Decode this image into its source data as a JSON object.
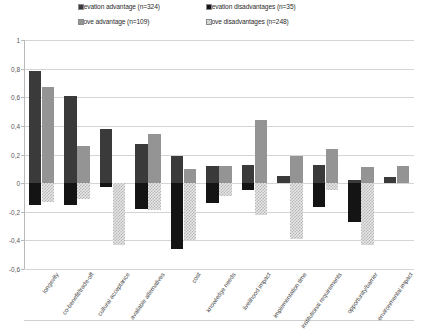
{
  "chart_data": {
    "type": "bar",
    "title": "",
    "subtitle": "",
    "xlabel": "",
    "ylabel": "",
    "ylim": [
      -0.6,
      1.0
    ],
    "ytick_labels": [
      "1",
      "0,8",
      "0,6",
      "0,4",
      "0,2",
      "0",
      "-0,2",
      "-0,4",
      "-0,6"
    ],
    "ytick_values": [
      1,
      0.8,
      0.6,
      0.4,
      0.2,
      0,
      -0.2,
      -0.4,
      -0.6
    ],
    "grid": true,
    "legend_position": "top",
    "orientation": "vertical",
    "bar_mode": "floating-stacked",
    "categories": [
      "longevity",
      "co-benefit/trade-off",
      "cultural acceptance",
      "available alternatives",
      "cost",
      "knowledge needs",
      "livelihood impact",
      "implementation time",
      "institutional requirements",
      "opportunity/barrier",
      "environmental impact"
    ],
    "series": [
      {
        "name": "Elevation advantage (n=324)",
        "key": "elev-adv",
        "color": "#3a3a3a",
        "values": [
          0.78,
          0.61,
          0.38,
          0.27,
          0.19,
          0.12,
          0.13,
          0.05,
          0.13,
          0.02,
          0.04
        ]
      },
      {
        "name": "Elevation disadvantages (n=35)",
        "key": "elev-dis",
        "color": "#141414",
        "values": [
          -0.15,
          -0.15,
          -0.03,
          -0.18,
          -0.46,
          -0.14,
          -0.05,
          0.0,
          -0.17,
          -0.27,
          0.0
        ]
      },
      {
        "name": "Move advantage (n=109)",
        "key": "move-adv",
        "color": "#949494",
        "values": [
          0.67,
          0.26,
          0.0,
          0.34,
          0.1,
          0.12,
          0.44,
          0.19,
          0.24,
          0.11,
          0.12
        ]
      },
      {
        "name": "Move disadvantages (n=248)",
        "key": "move-dis",
        "color": "#c8c8c8",
        "values": [
          -0.13,
          -0.11,
          -0.43,
          -0.19,
          -0.4,
          -0.09,
          -0.22,
          -0.39,
          -0.05,
          -0.43,
          0.0
        ]
      }
    ]
  },
  "legend": {
    "items": [
      {
        "label": "Elevation advantage (n=324)",
        "key": "elev-adv"
      },
      {
        "label": "Elevation disadvantages (n=35)",
        "key": "elev-dis"
      },
      {
        "label": "Move advantage (n=109)",
        "key": "move-adv"
      },
      {
        "label": "Move disadvantages (n=248)",
        "key": "move-dis"
      }
    ]
  }
}
